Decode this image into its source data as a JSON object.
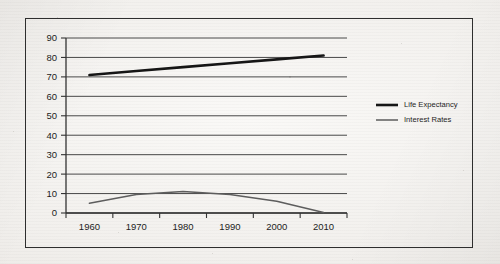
{
  "chart_data": {
    "type": "line",
    "title": "",
    "xlabel": "",
    "ylabel": "",
    "categories": [
      "1960",
      "1970",
      "1980",
      "1990",
      "2000",
      "2010"
    ],
    "x": [
      1960,
      1970,
      1980,
      1990,
      2000,
      2010
    ],
    "xlim": [
      1960,
      2010
    ],
    "ylim": [
      0,
      90
    ],
    "yticks": [
      "0",
      "10",
      "20",
      "30",
      "40",
      "50",
      "60",
      "70",
      "80",
      "90"
    ],
    "ytick_values": [
      0,
      10,
      20,
      30,
      40,
      50,
      60,
      70,
      80,
      90
    ],
    "grid": "horizontal",
    "legend_position": "right",
    "series": [
      {
        "name": "Life Expectancy",
        "values": [
          71,
          73,
          75,
          77,
          79,
          81
        ],
        "color": "#161616",
        "line_width": 2.6
      },
      {
        "name": "Interest Rates",
        "values": [
          5,
          9.5,
          11,
          9.5,
          6,
          0.3
        ],
        "color": "#5d5d5d",
        "line_width": 1.5
      }
    ]
  },
  "legend": {
    "items": [
      {
        "label": "Life Expectancy",
        "color": "#161616",
        "line_width": 2.6
      },
      {
        "label": "Interest Rates",
        "color": "#5d5d5d",
        "line_width": 1.5
      }
    ]
  },
  "colors": {
    "paper": "#f2f0ed",
    "frame": "#2e2e2e",
    "axis": "#333333",
    "gridline": "#4a4a4a",
    "text": "#1d1d1d"
  }
}
